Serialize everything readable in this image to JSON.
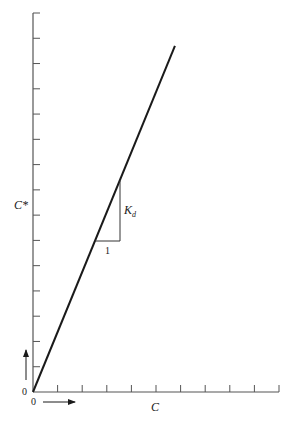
{
  "chart_data": {
    "type": "line",
    "title": "",
    "xlabel": "C",
    "ylabel": "C*",
    "x_origin_label": "0",
    "y_origin_label": "0",
    "x_ticks": 10,
    "y_ticks": 15,
    "xlim": [
      0,
      10
    ],
    "ylim": [
      0,
      15
    ],
    "grid": false,
    "series": [
      {
        "name": "isotherm",
        "x": [
          0,
          5.77
        ],
        "y": [
          0,
          13.7
        ]
      }
    ],
    "annotations": {
      "slope_triangle": {
        "run_label": "1",
        "rise_label": "K",
        "rise_label_sub": "d",
        "x_start": 2.5,
        "x_end": 3.5,
        "y_base": 5.96,
        "y_top": 8.3
      },
      "x_direction_arrow": true,
      "y_direction_arrow": true
    }
  },
  "labels": {
    "y_axis": "C*",
    "x_axis": "C",
    "origin_x": "0",
    "origin_y": "0",
    "run": "1",
    "rise_main": "K",
    "rise_sub": "d"
  },
  "colors": {
    "ink": "#1a1a1a",
    "axis": "#555555",
    "background": "#ffffff"
  }
}
